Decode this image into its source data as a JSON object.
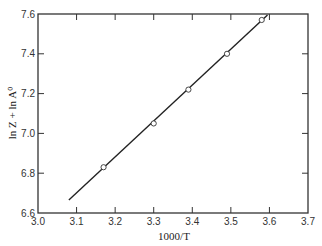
{
  "chart_data": {
    "type": "scatter",
    "title": "",
    "xlabel": "1000/T",
    "ylabel": "ln Z + ln A⁰",
    "xlim": [
      3.0,
      3.7
    ],
    "ylim": [
      6.6,
      7.6
    ],
    "xticks": [
      3.0,
      3.1,
      3.2,
      3.3,
      3.4,
      3.5,
      3.6,
      3.7
    ],
    "xtick_labels": [
      "3.0",
      "3.1",
      "3.2",
      "3.3",
      "3.4",
      "3.5",
      "3.6",
      "3.7"
    ],
    "yticks": [
      6.6,
      6.8,
      7.0,
      7.2,
      7.4,
      7.6
    ],
    "ytick_labels": [
      "6.6",
      "6.8",
      "7.0",
      "7.2",
      "7.4",
      "7.6"
    ],
    "grid": false,
    "legend": null,
    "series": [
      {
        "name": "data",
        "marker": "open-circle",
        "x": [
          3.17,
          3.3,
          3.39,
          3.49,
          3.58
        ],
        "y": [
          6.83,
          7.05,
          7.22,
          7.4,
          7.57
        ]
      },
      {
        "name": "fit",
        "style": "line",
        "x": [
          3.08,
          3.595
        ],
        "y": [
          6.665,
          7.595
        ]
      }
    ]
  },
  "colors": {
    "axis": "#333333",
    "line": "#222222",
    "marker_fill": "#ffffff",
    "marker_edge": "#333333"
  }
}
